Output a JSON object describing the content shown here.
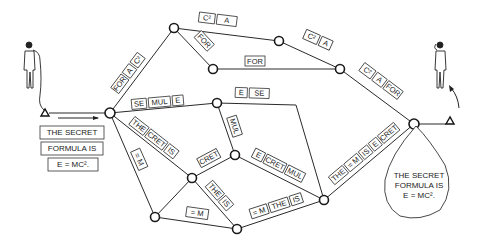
{
  "diagram": {
    "type": "packet-switching-network",
    "sender": {
      "label": "sender-person"
    },
    "receiver": {
      "label": "receiver-person"
    },
    "original_message": {
      "lines": [
        "THE SECRET",
        "FORMULA IS",
        "E = MC²."
      ]
    },
    "received_message": {
      "lines": [
        "THE SECRET",
        "FORMULA IS",
        "E = MC²."
      ]
    },
    "nodes": [
      {
        "id": "A",
        "x": 110,
        "y": 113
      },
      {
        "id": "B",
        "x": 174,
        "y": 28
      },
      {
        "id": "C",
        "x": 279,
        "y": 41
      },
      {
        "id": "D",
        "x": 213,
        "y": 69
      },
      {
        "id": "E",
        "x": 340,
        "y": 69
      },
      {
        "id": "F",
        "x": 414,
        "y": 124
      },
      {
        "id": "G",
        "x": 217,
        "y": 103
      },
      {
        "id": "H",
        "x": 235,
        "y": 155
      },
      {
        "id": "I",
        "x": 192,
        "y": 178
      },
      {
        "id": "J",
        "x": 155,
        "y": 217
      },
      {
        "id": "K",
        "x": 237,
        "y": 229
      },
      {
        "id": "L",
        "x": 324,
        "y": 200
      }
    ],
    "paths": [
      {
        "id": "A-B",
        "packets": [
          "FOR",
          "A",
          "C²"
        ]
      },
      {
        "id": "B-C",
        "packets": [
          "C²",
          "A"
        ]
      },
      {
        "id": "B-D",
        "packets": [
          "FOR"
        ]
      },
      {
        "id": "D-E",
        "packets": [
          "FOR"
        ]
      },
      {
        "id": "C-E",
        "packets": [
          "C²",
          "A"
        ]
      },
      {
        "id": "E-F",
        "packets": [
          "C²",
          "A",
          "FOR"
        ]
      },
      {
        "id": "A-G",
        "packets": [
          "SE",
          "MUL",
          "E"
        ]
      },
      {
        "id": "G-L",
        "packets": [
          "E",
          "SE"
        ]
      },
      {
        "id": "G-H",
        "packets": [
          "MUL"
        ]
      },
      {
        "id": "A-I",
        "packets": [
          "THE",
          "CRET",
          "IS"
        ]
      },
      {
        "id": "I-H",
        "packets": [
          "CRET"
        ]
      },
      {
        "id": "H-L",
        "packets": [
          "E",
          "CRET",
          "MUL"
        ]
      },
      {
        "id": "A-J",
        "packets": [
          "= M"
        ]
      },
      {
        "id": "J-K",
        "packets": [
          "= M"
        ]
      },
      {
        "id": "I-K",
        "packets": [
          "THE",
          "IS"
        ]
      },
      {
        "id": "K-L",
        "packets": [
          "= M",
          "THE",
          "IS"
        ]
      },
      {
        "id": "L-F",
        "packets": [
          "THE",
          "= M",
          "IS",
          "E",
          "CRET"
        ]
      }
    ]
  }
}
